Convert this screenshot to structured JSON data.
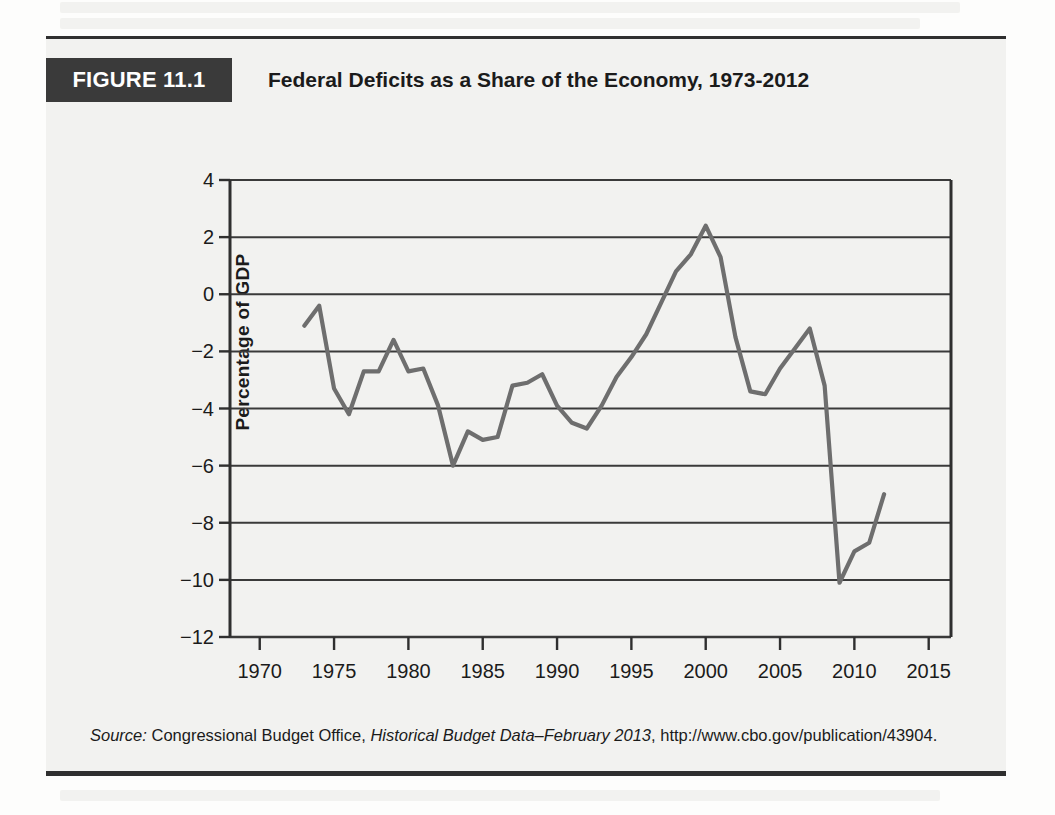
{
  "figure": {
    "badge": "FIGURE 11.1",
    "title": "Federal Deficits as a Share of the Economy, 1973-2012",
    "source_label": "Source:",
    "source_org": "Congressional Budget Office,",
    "source_pub": "Historical Budget Data–February 2013",
    "source_rest": ", http://www.cbo.gov/publication/43904.",
    "colors": {
      "badge_bg": "#3a3a3a",
      "card_bg": "#f2f2f0",
      "rule": "#2f2f2f",
      "line": "#6e6e6e",
      "grid": "#3a3a3a",
      "text": "#1b1b1b"
    }
  },
  "chart_data": {
    "type": "line",
    "title": "Federal Deficits as a Share of the Economy, 1973-2012",
    "xlabel": "",
    "ylabel": "Percentage of GDP",
    "xlim": [
      1968,
      2016.5
    ],
    "ylim": [
      -12,
      4
    ],
    "xticks": [
      1970,
      1975,
      1980,
      1985,
      1990,
      1995,
      2000,
      2005,
      2010,
      2015
    ],
    "yticks": [
      4,
      2,
      0,
      -2,
      -4,
      -6,
      -8,
      -10,
      -12
    ],
    "grid": "horizontal",
    "legend": "none",
    "series": [
      {
        "name": "Federal surplus/deficit as % of GDP",
        "x": [
          1973,
          1974,
          1975,
          1976,
          1977,
          1978,
          1979,
          1980,
          1981,
          1982,
          1983,
          1984,
          1985,
          1986,
          1987,
          1988,
          1989,
          1990,
          1991,
          1992,
          1993,
          1994,
          1995,
          1996,
          1997,
          1998,
          1999,
          2000,
          2001,
          2002,
          2003,
          2004,
          2005,
          2006,
          2007,
          2008,
          2009,
          2010,
          2011,
          2012
        ],
        "values": [
          -1.1,
          -0.4,
          -3.3,
          -4.2,
          -2.7,
          -2.7,
          -1.6,
          -2.7,
          -2.6,
          -3.9,
          -6.0,
          -4.8,
          -5.1,
          -5.0,
          -3.2,
          -3.1,
          -2.8,
          -3.9,
          -4.5,
          -4.7,
          -3.9,
          -2.9,
          -2.2,
          -1.4,
          -0.3,
          0.8,
          1.4,
          2.4,
          1.3,
          -1.5,
          -3.4,
          -3.5,
          -2.6,
          -1.9,
          -1.2,
          -3.2,
          -10.1,
          -9.0,
          -8.7,
          -7.0
        ]
      }
    ]
  }
}
